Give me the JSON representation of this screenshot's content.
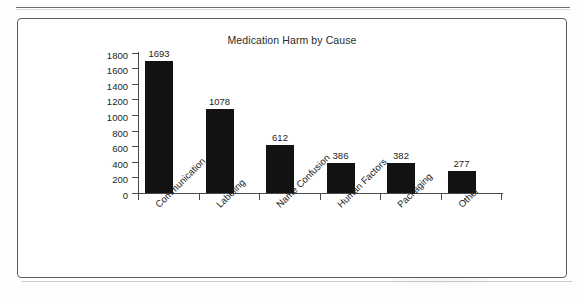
{
  "figure": {
    "frame_border_color": "#5c5c5e",
    "background_color": "#ffffff",
    "bar_color": "#121212",
    "axis_color": "#4a4a4c",
    "text_color": "#1d1d1d"
  },
  "chart_data": {
    "type": "bar",
    "title": "Medication Harm by Cause",
    "xlabel": "",
    "ylabel": "",
    "categories": [
      "Communication",
      "Labeling",
      "Name Confusion",
      "Human Factors",
      "Packaging",
      "Other"
    ],
    "values": [
      1693,
      1078,
      612,
      386,
      382,
      277
    ],
    "data_labels": [
      "1693",
      "1078",
      "612",
      "386",
      "382",
      "277"
    ],
    "ylim": [
      0,
      1800
    ],
    "yticks": [
      0,
      200,
      400,
      600,
      800,
      1000,
      1200,
      1400,
      1600,
      1800
    ],
    "ytick_labels": [
      "0",
      "200",
      "400",
      "600",
      "800",
      "1000",
      "1200",
      "1400",
      "1600",
      "1800"
    ],
    "grid": false,
    "legend": null,
    "legend_position": "none",
    "orientation": "vertical",
    "category_label_rotation": -45
  }
}
